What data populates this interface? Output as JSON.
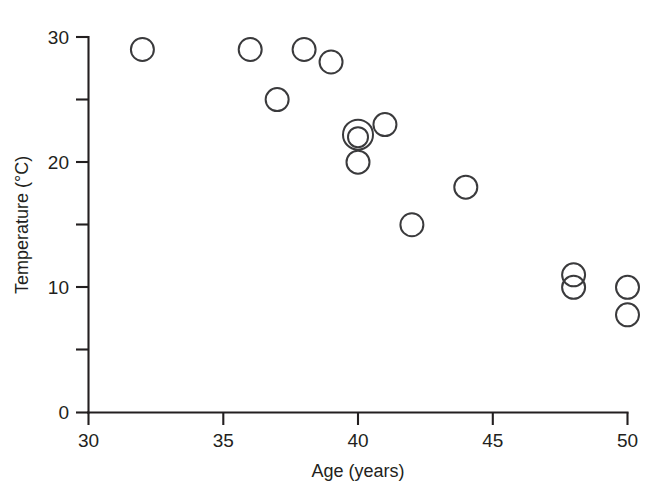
{
  "chart_data": {
    "type": "scatter",
    "title": "",
    "subtitle": "",
    "xlabel": "Age (years)",
    "ylabel": "Temperature (°C)",
    "xlim": [
      30,
      50
    ],
    "ylim": [
      0,
      30
    ],
    "grid": false,
    "legend": null,
    "marker": "open-circle",
    "marker_color": "#3a3a3c",
    "axis_color": "#231f20",
    "background": "#ffffff",
    "xticks": [
      30,
      35,
      40,
      45,
      50
    ],
    "xtick_labels": [
      "30",
      "35",
      "40",
      "45",
      "50"
    ],
    "xminor_ticks": [],
    "yticks": [
      0,
      10,
      20,
      30
    ],
    "ytick_labels": [
      "0",
      "10",
      "20",
      "30"
    ],
    "yminor_ticks": [
      5,
      15,
      25
    ],
    "points": [
      {
        "x": 32.0,
        "y": 29.0
      },
      {
        "x": 36.0,
        "y": 29.0
      },
      {
        "x": 38.0,
        "y": 29.0
      },
      {
        "x": 39.0,
        "y": 28.0
      },
      {
        "x": 37.0,
        "y": 25.0
      },
      {
        "x": 41.0,
        "y": 23.0
      },
      {
        "x": 40.0,
        "y": 22.2
      },
      {
        "x": 40.0,
        "y": 22.0
      },
      {
        "x": 40.0,
        "y": 20.0
      },
      {
        "x": 44.0,
        "y": 18.0
      },
      {
        "x": 42.0,
        "y": 15.0
      },
      {
        "x": 48.0,
        "y": 11.0
      },
      {
        "x": 48.0,
        "y": 10.0
      },
      {
        "x": 50.0,
        "y": 10.0
      },
      {
        "x": 50.0,
        "y": 7.8
      }
    ],
    "overlapping_note": "Two nearly coincident markers drawn at (40, 22) appear as concentric circles"
  },
  "axes": {
    "x_title": "Age (years)",
    "y_title": "Temperature (°C)",
    "x_tick_labels": [
      "30",
      "35",
      "40",
      "45",
      "50"
    ],
    "y_tick_labels": [
      "0",
      "10",
      "20",
      "30"
    ]
  }
}
